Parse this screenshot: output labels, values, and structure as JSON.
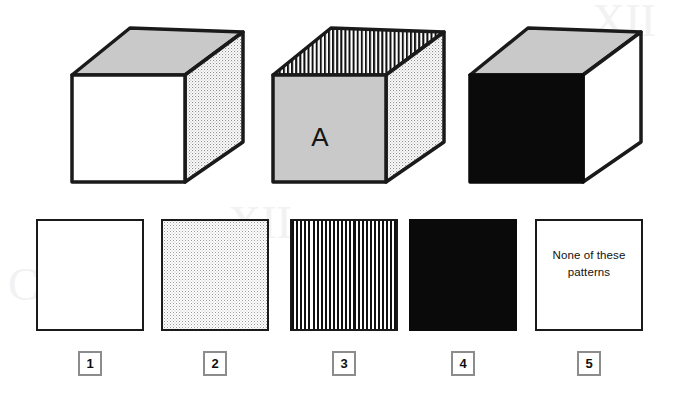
{
  "figure": {
    "type": "pattern-matching-puzzle",
    "background_color": "#ffffff",
    "stroke_color": "#1a1a1a",
    "gray_fill": "#c9c9c9",
    "black_fill": "#0a0a0a",
    "white_fill": "#ffffff"
  },
  "cubes": [
    {
      "id": "cube-1",
      "label": "",
      "top_face_pattern": "solid-gray",
      "front_face_pattern": "solid-white",
      "side_face_pattern": "dotted"
    },
    {
      "id": "cube-2",
      "label": "A",
      "top_face_pattern": "vertical-stripes",
      "front_face_pattern": "solid-gray",
      "side_face_pattern": "dotted"
    },
    {
      "id": "cube-3",
      "label": "",
      "top_face_pattern": "solid-gray",
      "front_face_pattern": "solid-black",
      "side_face_pattern": "solid-white"
    }
  ],
  "answers": [
    {
      "number": "1",
      "pattern": "solid-white",
      "text": ""
    },
    {
      "number": "2",
      "pattern": "dotted",
      "text": ""
    },
    {
      "number": "3",
      "pattern": "vertical-stripes",
      "text": ""
    },
    {
      "number": "4",
      "pattern": "solid-black",
      "text": ""
    },
    {
      "number": "5",
      "pattern": "solid-white",
      "text": "None of these patterns"
    }
  ]
}
